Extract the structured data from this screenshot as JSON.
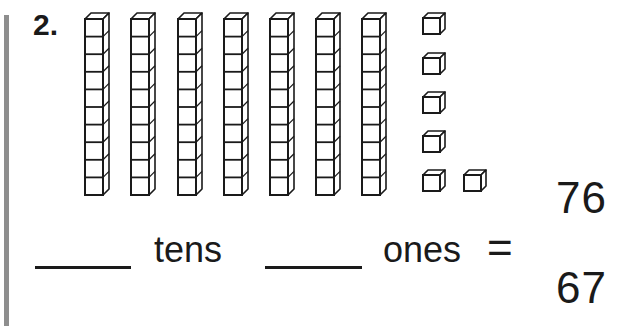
{
  "problem": {
    "number": "2.",
    "tens_rods": 7,
    "cubes_per_rod": 10,
    "unit_cubes": 6
  },
  "sentence": {
    "blank_tens": "",
    "tens_label": "tens",
    "blank_ones": "",
    "ones_label": "ones",
    "equals": "="
  },
  "choices": [
    {
      "value": "76"
    },
    {
      "value": "67"
    }
  ],
  "colors": {
    "ink": "#1a1a1a",
    "margin_bar": "#8e8e8e",
    "background": "#ffffff"
  }
}
